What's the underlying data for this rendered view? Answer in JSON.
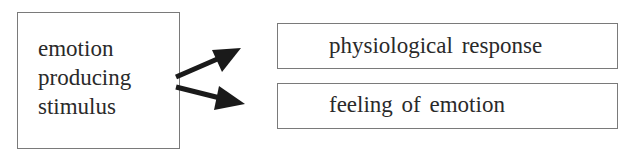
{
  "diagram": {
    "source_node": {
      "lines": [
        "emotion",
        "producing",
        "stimulus"
      ]
    },
    "target_nodes": [
      {
        "label": "physiological  response"
      },
      {
        "label": "feeling of emotion"
      }
    ],
    "edges": [
      {
        "from": "emotion producing stimulus",
        "to": "physiological response"
      },
      {
        "from": "emotion producing stimulus",
        "to": "feeling of emotion"
      }
    ],
    "colors": {
      "border": "#7a7a7a",
      "arrow": "#1a1a1a",
      "text": "#2a2a2a"
    }
  }
}
